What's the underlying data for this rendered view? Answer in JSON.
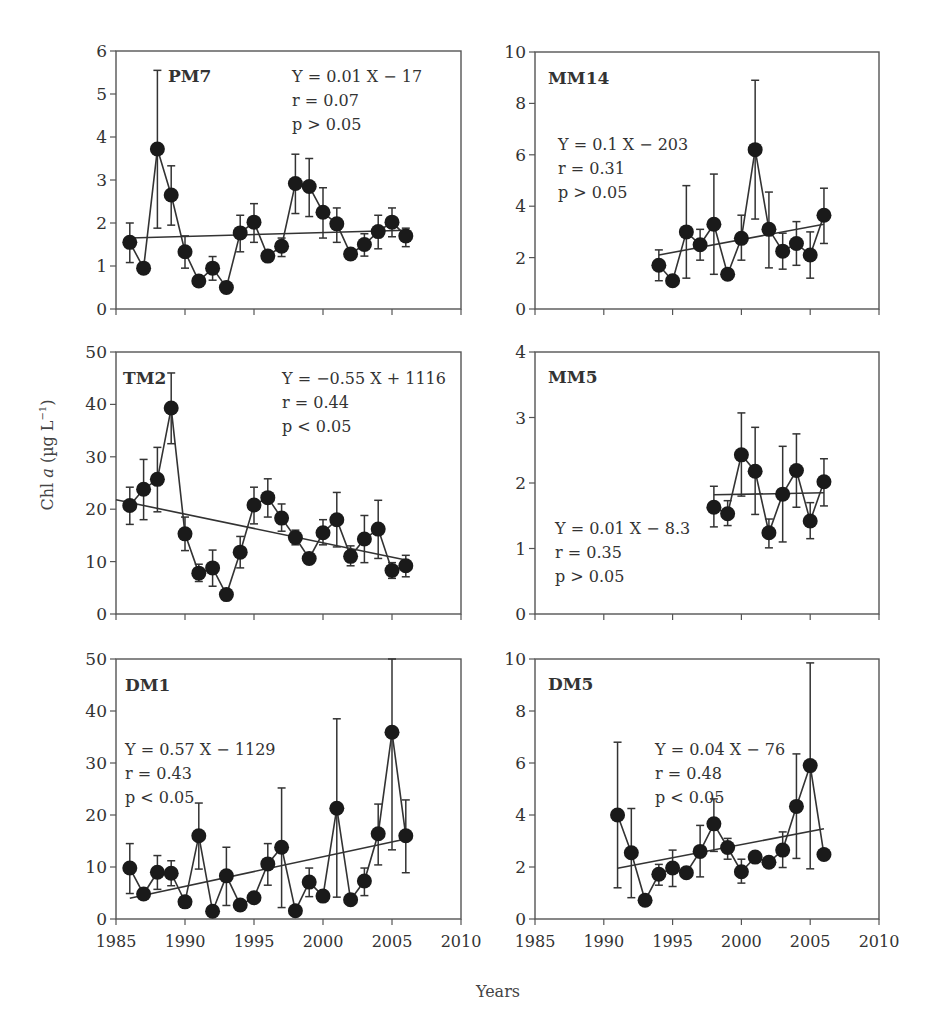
{
  "figure": {
    "ylabel": "Chl a (µg L⁻¹)",
    "ylabel_parts": {
      "pre": "Chl ",
      "italic": "a",
      "post": " (µg L",
      "sup": "−1",
      "close": ")"
    },
    "xlabel": "Years",
    "x_ticks": [
      1985,
      1990,
      1995,
      2000,
      2005,
      2010
    ],
    "colors": {
      "marker": "#1a1a1a",
      "line": "#333333",
      "frame": "#555555",
      "text": "#333333"
    }
  },
  "chart_data": [
    {
      "type": "line",
      "panel": "PM7",
      "title": "PM7",
      "xlim": [
        1985,
        2010
      ],
      "ylim": [
        0,
        6
      ],
      "y_ticks": [
        0,
        1,
        2,
        3,
        4,
        5,
        6
      ],
      "equation": "Y = 0.01 X − 17",
      "r": "r = 0.07",
      "p": "p > 0.05",
      "x": [
        1986,
        1987,
        1988,
        1989,
        1990,
        1991,
        1992,
        1993,
        1994,
        1995,
        1996,
        1997,
        1998,
        1999,
        2000,
        2001,
        2002,
        2003,
        2004,
        2005,
        2006
      ],
      "values": [
        1.55,
        0.95,
        3.72,
        2.65,
        1.33,
        0.65,
        0.95,
        0.5,
        1.77,
        2.02,
        1.23,
        1.46,
        2.92,
        2.85,
        2.25,
        1.98,
        1.28,
        1.5,
        1.8,
        2.02,
        1.7
      ],
      "err_upper": [
        2.0,
        null,
        5.55,
        3.33,
        1.7,
        null,
        1.22,
        null,
        2.18,
        2.45,
        null,
        1.65,
        3.6,
        3.5,
        2.82,
        2.35,
        null,
        1.75,
        2.18,
        2.35,
        1.88
      ],
      "err_lower": [
        1.08,
        null,
        1.88,
        1.95,
        0.95,
        null,
        0.67,
        null,
        1.33,
        1.55,
        null,
        1.22,
        2.22,
        2.15,
        1.65,
        1.55,
        null,
        1.23,
        1.4,
        1.68,
        1.45
      ],
      "trend": {
        "x": [
          1986,
          2006
        ],
        "y": [
          1.65,
          1.83
        ]
      },
      "layout": {
        "left": 116,
        "right": 461,
        "top": 51,
        "bottom": 309,
        "title_pos": [
          168,
          82
        ],
        "eq_pos": [
          292,
          82
        ],
        "title_anchor": "start"
      }
    },
    {
      "type": "line",
      "panel": "MM14",
      "title": "MM14",
      "xlim": [
        1985,
        2010
      ],
      "ylim": [
        0,
        10
      ],
      "y_ticks": [
        0,
        2,
        4,
        6,
        8,
        10
      ],
      "equation": "Y = 0.1 X − 203",
      "r": "r = 0.31",
      "p": "p > 0.05",
      "x": [
        1994,
        1995,
        1996,
        1997,
        1998,
        1999,
        2000,
        2001,
        2002,
        2003,
        2004,
        2005,
        2006
      ],
      "values": [
        1.7,
        1.1,
        3.0,
        2.5,
        3.3,
        1.35,
        2.75,
        6.2,
        3.1,
        2.25,
        2.55,
        2.1,
        3.65
      ],
      "err_upper": [
        2.3,
        null,
        4.8,
        3.1,
        5.25,
        null,
        3.65,
        8.9,
        4.55,
        2.95,
        3.4,
        3.0,
        4.7
      ],
      "err_lower": [
        1.1,
        null,
        1.2,
        1.9,
        1.35,
        null,
        1.9,
        3.5,
        1.6,
        1.55,
        1.7,
        1.2,
        2.55
      ],
      "trend": {
        "x": [
          1994,
          2006
        ],
        "y": [
          2.1,
          3.3
        ]
      },
      "layout": {
        "left": 535,
        "right": 879,
        "top": 52,
        "bottom": 309,
        "title_pos": [
          548,
          84
        ],
        "eq_pos": [
          558,
          150
        ]
      }
    },
    {
      "type": "line",
      "panel": "TM2",
      "title": "TM2",
      "xlim": [
        1985,
        2010
      ],
      "ylim": [
        0,
        50
      ],
      "y_ticks": [
        0,
        10,
        20,
        30,
        40,
        50
      ],
      "equation": "Y = −0.55 X + 1116",
      "r": "r = 0.44",
      "p": "p < 0.05",
      "x": [
        1986,
        1987,
        1988,
        1989,
        1990,
        1991,
        1992,
        1993,
        1994,
        1995,
        1996,
        1997,
        1998,
        1999,
        2000,
        2001,
        2002,
        2003,
        2004,
        2005,
        2006
      ],
      "values": [
        20.7,
        23.8,
        25.7,
        39.3,
        15.3,
        7.8,
        8.8,
        3.7,
        11.8,
        20.8,
        22.2,
        18.3,
        14.6,
        10.6,
        15.5,
        18.0,
        11.0,
        14.3,
        16.2,
        8.3,
        9.2
      ],
      "err_upper": [
        24.2,
        29.5,
        31.8,
        46.0,
        18.5,
        9.5,
        12.2,
        null,
        14.8,
        24.2,
        25.8,
        21.0,
        16.0,
        null,
        18.0,
        23.2,
        13.0,
        18.8,
        21.7,
        9.8,
        11.2
      ],
      "err_lower": [
        17.1,
        18.0,
        19.5,
        32.5,
        12.1,
        6.2,
        5.3,
        null,
        8.8,
        17.2,
        18.5,
        15.8,
        13.2,
        null,
        13.2,
        12.8,
        9.2,
        9.8,
        10.6,
        6.8,
        7.1
      ],
      "trend": {
        "x": [
          1985,
          2006
        ],
        "y": [
          21.8,
          10.3
        ]
      },
      "layout": {
        "left": 116,
        "right": 461,
        "top": 352,
        "bottom": 614,
        "title_pos": [
          123,
          384
        ],
        "eq_pos": [
          282,
          384
        ]
      }
    },
    {
      "type": "line",
      "panel": "MM5",
      "title": "MM5",
      "xlim": [
        1985,
        2010
      ],
      "ylim": [
        0,
        4
      ],
      "y_ticks": [
        0,
        1,
        2,
        3,
        4
      ],
      "equation": "Y = 0.01 X − 8.3",
      "r": "r = 0.35",
      "p": "p > 0.05",
      "x": [
        1998,
        1999,
        2000,
        2001,
        2002,
        2003,
        2004,
        2005,
        2006
      ],
      "values": [
        1.63,
        1.53,
        2.43,
        2.18,
        1.24,
        1.83,
        2.19,
        1.42,
        2.02
      ],
      "err_upper": [
        1.95,
        1.73,
        3.07,
        2.85,
        1.45,
        2.56,
        2.75,
        1.7,
        2.37
      ],
      "err_lower": [
        1.33,
        1.35,
        1.8,
        1.52,
        1.01,
        1.1,
        1.63,
        1.15,
        1.65
      ],
      "trend": {
        "x": [
          1998,
          2006
        ],
        "y": [
          1.82,
          1.85
        ]
      },
      "layout": {
        "left": 535,
        "right": 879,
        "top": 352,
        "bottom": 614,
        "title_pos": [
          548,
          383
        ],
        "eq_pos": [
          555,
          534
        ]
      }
    },
    {
      "type": "line",
      "panel": "DM1",
      "title": "DM1",
      "xlim": [
        1985,
        2010
      ],
      "ylim": [
        0,
        50
      ],
      "y_ticks": [
        0,
        10,
        20,
        30,
        40,
        50
      ],
      "equation": "Y = 0.57 X − 1129",
      "r": "r = 0.43",
      "p": "p < 0.05",
      "x": [
        1986,
        1987,
        1988,
        1989,
        1990,
        1991,
        1992,
        1993,
        1994,
        1995,
        1996,
        1997,
        1998,
        1999,
        2000,
        2001,
        2002,
        2003,
        2004,
        2005,
        2006
      ],
      "values": [
        9.8,
        4.8,
        9.0,
        8.8,
        3.3,
        16.0,
        1.5,
        8.3,
        2.7,
        4.1,
        10.6,
        13.8,
        1.6,
        7.1,
        4.4,
        21.3,
        3.7,
        7.3,
        16.4,
        35.9,
        16.0
      ],
      "err_upper": [
        14.5,
        null,
        12.2,
        11.2,
        null,
        22.3,
        null,
        13.8,
        null,
        null,
        14.5,
        25.2,
        null,
        9.8,
        null,
        38.5,
        null,
        9.8,
        22.1,
        50.0,
        22.9
      ],
      "err_lower": [
        4.9,
        null,
        5.7,
        6.4,
        null,
        9.6,
        null,
        2.6,
        null,
        null,
        6.5,
        2.2,
        null,
        4.3,
        null,
        4.2,
        null,
        4.5,
        10.4,
        13.3,
        8.9
      ],
      "trend": {
        "x": [
          1986,
          2006
        ],
        "y": [
          4.0,
          15.4
        ]
      },
      "layout": {
        "left": 116,
        "right": 461,
        "top": 659,
        "bottom": 919,
        "title_pos": [
          125,
          691
        ],
        "eq_pos": [
          125,
          755
        ]
      }
    },
    {
      "type": "line",
      "panel": "DM5",
      "title": "DM5",
      "xlim": [
        1985,
        2010
      ],
      "ylim": [
        0,
        10
      ],
      "y_ticks": [
        0,
        2,
        4,
        6,
        8,
        10
      ],
      "equation": "Y = 0.04 X − 76",
      "r": "r = 0.48",
      "p": "p < 0.05",
      "x": [
        1991,
        1992,
        1993,
        1994,
        1995,
        1996,
        1997,
        1998,
        1999,
        2000,
        2001,
        2002,
        2003,
        2004,
        2005,
        2006
      ],
      "values": [
        4.0,
        2.55,
        0.72,
        1.72,
        1.96,
        1.78,
        2.6,
        3.66,
        2.75,
        1.82,
        2.38,
        2.18,
        2.65,
        4.33,
        5.9,
        2.48
      ],
      "err_upper": [
        6.8,
        4.25,
        null,
        2.1,
        2.65,
        null,
        3.6,
        4.62,
        3.1,
        2.3,
        null,
        null,
        3.35,
        6.35,
        9.85,
        null
      ],
      "err_lower": [
        1.2,
        0.82,
        null,
        1.3,
        1.25,
        null,
        1.62,
        2.6,
        2.3,
        1.38,
        null,
        null,
        1.98,
        2.33,
        1.93,
        null
      ],
      "trend": {
        "x": [
          1991,
          2006
        ],
        "y": [
          1.95,
          3.47
        ]
      },
      "layout": {
        "left": 535,
        "right": 879,
        "top": 659,
        "bottom": 919,
        "title_pos": [
          548,
          690
        ],
        "eq_pos": [
          655,
          755
        ]
      }
    }
  ]
}
